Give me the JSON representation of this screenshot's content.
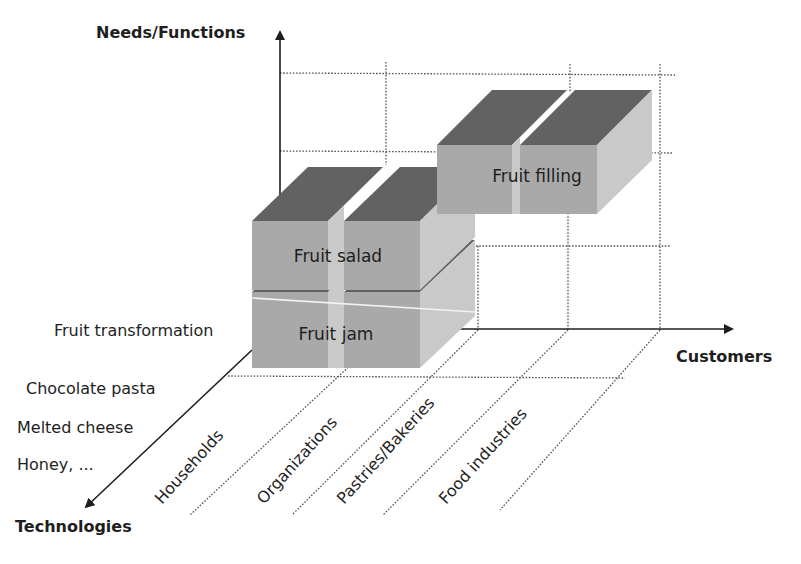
{
  "diagram": {
    "type": "3d-business-definition-cube",
    "axes": {
      "vertical": {
        "label": "Needs/Functions"
      },
      "horizontal": {
        "label": "Customers"
      },
      "depth": {
        "label": "Technologies"
      }
    },
    "technologies": [
      "Fruit transformation",
      "Chocolate pasta",
      "Melted cheese",
      "Honey, ..."
    ],
    "customers": [
      "Households",
      "Organizations",
      "Pastries/Bakeries",
      "Food industries"
    ],
    "blocks": [
      {
        "label": "Fruit salad",
        "customers": [
          "Households",
          "Organizations"
        ]
      },
      {
        "label": "Fruit jam",
        "customers": [
          "Households",
          "Organizations"
        ]
      },
      {
        "label": "Fruit filling",
        "customers": [
          "Pastries/Bakeries",
          "Food industries"
        ]
      }
    ],
    "colors": {
      "front": "#a9a9a9",
      "top": "#626262",
      "side": "#c9c9c9",
      "text": "#1e1e1e"
    }
  }
}
